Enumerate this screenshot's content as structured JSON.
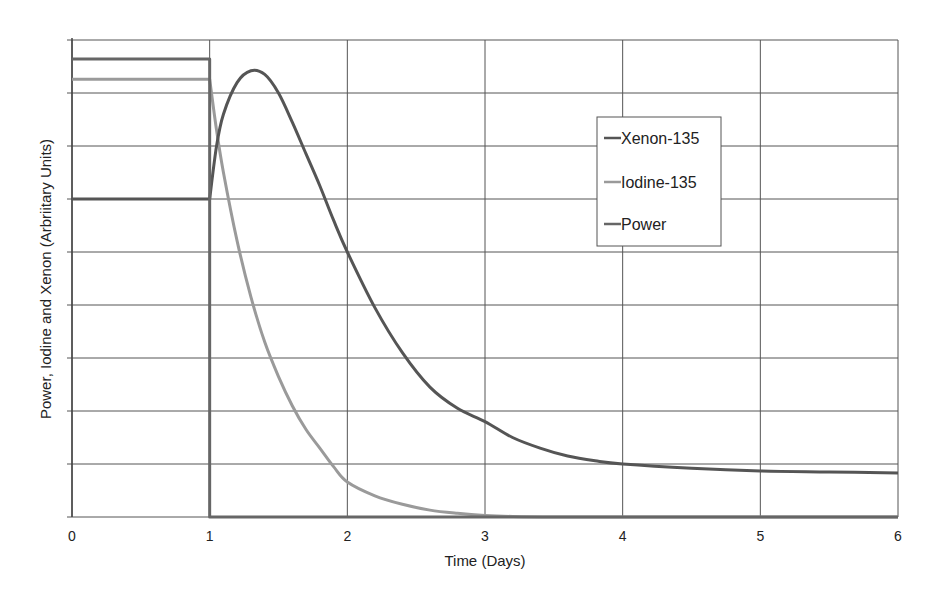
{
  "chart_data": {
    "type": "line",
    "title": "",
    "xlabel": "Time (Days)",
    "ylabel": "Power, Iodine and Xenon (Arbriitary Units)",
    "xlim": [
      0,
      6
    ],
    "ylim": [
      0,
      9
    ],
    "xticks": [
      "0",
      "1",
      "2",
      "3",
      "4",
      "5",
      "6"
    ],
    "yticks_labeled": false,
    "y_gridlines": [
      0,
      1,
      2,
      3,
      4,
      5,
      6,
      7,
      8,
      9
    ],
    "grid": true,
    "legend_position": "upper-right-inside",
    "series": [
      {
        "name": "Xenon-135",
        "color": "#555555",
        "x": [
          0,
          1,
          1.05,
          1.1,
          1.2,
          1.3,
          1.4,
          1.5,
          1.6,
          1.7,
          1.8,
          1.9,
          2.0,
          2.2,
          2.4,
          2.6,
          2.8,
          3.0,
          3.2,
          3.4,
          3.6,
          3.8,
          4.0,
          4.5,
          5.0,
          5.5,
          6.0
        ],
        "values": [
          6.0,
          6.0,
          7.0,
          7.6,
          8.2,
          8.42,
          8.35,
          8.0,
          7.45,
          6.85,
          6.25,
          5.6,
          5.0,
          3.95,
          3.1,
          2.45,
          2.05,
          1.8,
          1.5,
          1.3,
          1.15,
          1.06,
          1.0,
          0.92,
          0.87,
          0.85,
          0.83
        ]
      },
      {
        "name": "Iodine-135",
        "color": "#9a9a9a",
        "x": [
          0,
          1,
          1.05,
          1.1,
          1.2,
          1.3,
          1.4,
          1.5,
          1.6,
          1.7,
          1.8,
          1.9,
          2.0,
          2.2,
          2.4,
          2.6,
          2.8,
          3.0,
          3.2,
          3.5,
          4.0,
          5.0,
          6.0
        ],
        "values": [
          8.26,
          8.26,
          7.3,
          6.5,
          5.2,
          4.15,
          3.3,
          2.65,
          2.1,
          1.65,
          1.3,
          0.95,
          0.66,
          0.4,
          0.24,
          0.13,
          0.07,
          0.03,
          0.01,
          0.0,
          0.0,
          0.0,
          0.0
        ]
      },
      {
        "name": "Power",
        "color": "#666666",
        "x": [
          0,
          1,
          1,
          6
        ],
        "values": [
          8.64,
          8.64,
          0,
          0
        ]
      }
    ]
  },
  "legend": {
    "items": [
      {
        "label": "Xenon-135",
        "color": "#555555"
      },
      {
        "label": "Iodine-135",
        "color": "#9a9a9a"
      },
      {
        "label": "Power",
        "color": "#666666"
      }
    ]
  }
}
